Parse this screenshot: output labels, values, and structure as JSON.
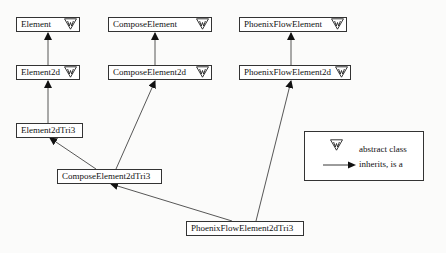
{
  "diagram": {
    "type": "uml-class-inheritance",
    "classes": [
      {
        "id": "element",
        "label": "Element",
        "abstract": true
      },
      {
        "id": "compose_element",
        "label": "ComposeElement",
        "abstract": true
      },
      {
        "id": "phoenix_flow_element",
        "label": "PhoenixFlowElement",
        "abstract": true
      },
      {
        "id": "element2d",
        "label": "Element2d",
        "abstract": true
      },
      {
        "id": "compose_element2d",
        "label": "ComposeElement2d",
        "abstract": true
      },
      {
        "id": "phoenix_flow_element2d",
        "label": "PhoenixFlowElement2d",
        "abstract": true
      },
      {
        "id": "element2dtri3",
        "label": "Element2dTri3",
        "abstract": false
      },
      {
        "id": "compose_element2dtri3",
        "label": "ComposeElement2dTri3",
        "abstract": false
      },
      {
        "id": "phoenix_flow_element2dtri3",
        "label": "PhoenixFlowElement2dTri3",
        "abstract": false
      }
    ],
    "inheritance": [
      {
        "from": "Element2d",
        "to": "Element"
      },
      {
        "from": "ComposeElement2d",
        "to": "ComposeElement"
      },
      {
        "from": "PhoenixFlowElement2d",
        "to": "PhoenixFlowElement"
      },
      {
        "from": "Element2dTri3",
        "to": "Element2d"
      },
      {
        "from": "ComposeElement2dTri3",
        "to": "Element2dTri3"
      },
      {
        "from": "ComposeElement2dTri3",
        "to": "ComposeElement2d"
      },
      {
        "from": "PhoenixFlowElement2dTri3",
        "to": "ComposeElement2dTri3"
      },
      {
        "from": "PhoenixFlowElement2dTri3",
        "to": "PhoenixFlowElement2d"
      }
    ],
    "legend": {
      "abstract_icon": "abstract-class-triangle-icon",
      "abstract_label": "abstract class",
      "arrow_icon": "inheritance-arrow-icon",
      "arrow_label": "inherits, is a"
    }
  }
}
